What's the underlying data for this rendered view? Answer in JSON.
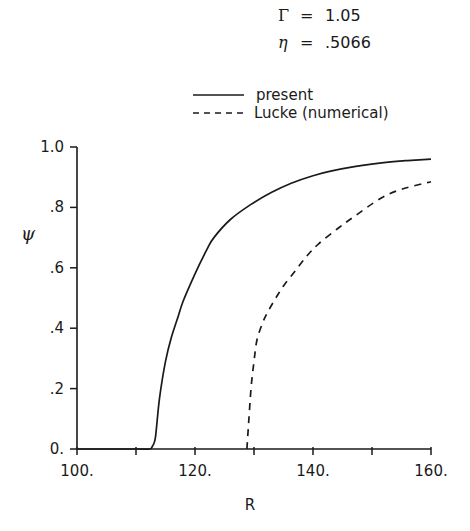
{
  "chart_data": {
    "type": "line",
    "title": "",
    "annotations": [
      {
        "symbol": "Γ",
        "eq": "=",
        "value": "1.05"
      },
      {
        "symbol": "η",
        "eq": "=",
        "value": ".5066"
      }
    ],
    "xlabel": "R",
    "ylabel": "ψ",
    "xlim": [
      100,
      160
    ],
    "ylim": [
      0,
      1.0
    ],
    "x_ticks": [
      100,
      110,
      120,
      130,
      140,
      150,
      160
    ],
    "x_tick_labels": [
      "100.",
      "120.",
      "140.",
      "160."
    ],
    "x_tick_label_values": [
      100,
      120,
      140,
      160
    ],
    "y_ticks": [
      0,
      0.2,
      0.4,
      0.6,
      0.8,
      1.0
    ],
    "y_tick_labels": [
      "0.",
      ".2",
      ".4",
      ".6",
      ".8",
      "1.0"
    ],
    "grid": false,
    "legend_position": "top-right (above plot)",
    "series": [
      {
        "name": "present",
        "style": "solid",
        "x": [
          100,
          110,
          112.3,
          112.8,
          113.3,
          114,
          115,
          116,
          117,
          118,
          120,
          122,
          123.2,
          126,
          129.5,
          133,
          136.3,
          140,
          143,
          147,
          152,
          156,
          160
        ],
        "y": [
          0,
          0,
          0,
          0.01,
          0.04,
          0.17,
          0.29,
          0.37,
          0.43,
          0.49,
          0.58,
          0.66,
          0.7,
          0.76,
          0.81,
          0.85,
          0.88,
          0.905,
          0.92,
          0.935,
          0.948,
          0.955,
          0.96
        ]
      },
      {
        "name": "Lucke (numerical)",
        "style": "dashed",
        "x": [
          128.8,
          129,
          129.5,
          130,
          130.5,
          131.5,
          132.5,
          133.7,
          135,
          137,
          139,
          141,
          144.2,
          147,
          151.5,
          155,
          160
        ],
        "y": [
          0,
          0.06,
          0.2,
          0.29,
          0.36,
          0.42,
          0.46,
          0.5,
          0.54,
          0.59,
          0.64,
          0.68,
          0.73,
          0.77,
          0.83,
          0.86,
          0.885
        ]
      }
    ]
  }
}
